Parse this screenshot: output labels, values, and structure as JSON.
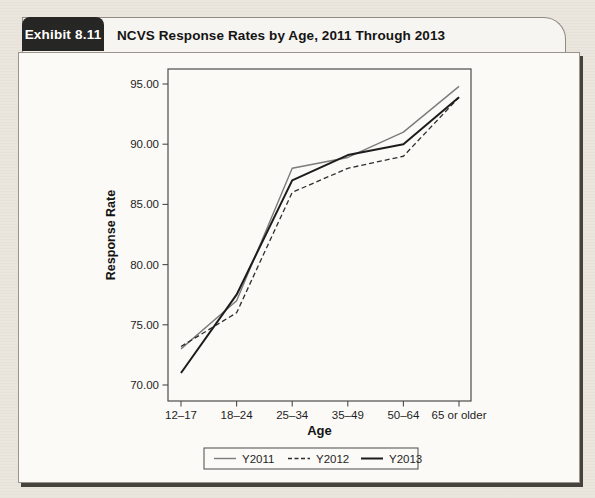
{
  "exhibit": {
    "number": "Exhibit 8.11",
    "title": "NCVS Response Rates by Age, 2011 Through 2013"
  },
  "chart_data": {
    "type": "line",
    "title": "NCVS Response Rates by Age, 2011 Through 2013",
    "categories": [
      "12–17",
      "18–24",
      "25–34",
      "35–49",
      "50–64",
      "65 or older"
    ],
    "series": [
      {
        "name": "Y2011",
        "style": "solid",
        "color": "#7b7b7b",
        "width": 1.4,
        "values": [
          73,
          77,
          88,
          88.9,
          91,
          94.8
        ]
      },
      {
        "name": "Y2012",
        "style": "dashed",
        "color": "#2e2e2e",
        "width": 1.3,
        "values": [
          73.2,
          76,
          86,
          88,
          89,
          93.9
        ]
      },
      {
        "name": "Y2013",
        "style": "solid",
        "color": "#1c1c1c",
        "width": 2,
        "values": [
          71,
          77.5,
          87,
          89.1,
          90,
          93.9
        ]
      }
    ],
    "xlabel": "Age",
    "ylabel": "Response Rate",
    "ylim": [
      68.5,
      96.3
    ],
    "yticks": [
      70,
      75,
      80,
      85,
      90,
      95
    ],
    "ytick_labels": [
      "70.00",
      "75.00",
      "80.00",
      "85.00",
      "90.00",
      "95.00"
    ],
    "grid": false,
    "legend_position": "bottom"
  }
}
